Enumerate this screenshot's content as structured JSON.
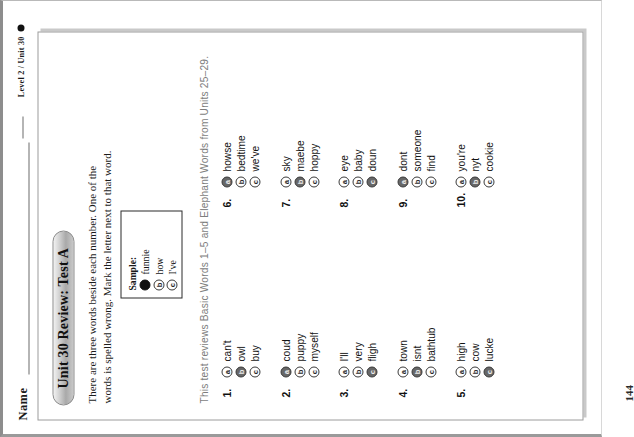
{
  "header": {
    "name_label": "Name",
    "level_label": "Level 2 / Unit 30"
  },
  "worksheet": {
    "title": "Unit 30 Review: Test A",
    "instructions": "There are three words beside each number. One of the words is spelled wrong. Mark the letter next to that word.",
    "review_line": "This test reviews Basic Words 1–5 and Elephant Words from Units 25–29.",
    "page_number": "144"
  },
  "sample": {
    "title": "Sample:",
    "options": [
      {
        "letter": "a",
        "word": "funnie",
        "marked": true
      },
      {
        "letter": "b",
        "word": "how",
        "marked": false
      },
      {
        "letter": "c",
        "word": "I've",
        "marked": false
      }
    ]
  },
  "questions_left": [
    {
      "number": "1.",
      "options": [
        {
          "letter": "a",
          "word": "can't",
          "marked": false
        },
        {
          "letter": "b",
          "word": "owl",
          "marked": true
        },
        {
          "letter": "c",
          "word": "buy",
          "marked": false
        }
      ]
    },
    {
      "number": "2.",
      "options": [
        {
          "letter": "a",
          "word": "coud",
          "marked": true
        },
        {
          "letter": "b",
          "word": "puppy",
          "marked": false
        },
        {
          "letter": "c",
          "word": "myself",
          "marked": false
        }
      ]
    },
    {
      "number": "3.",
      "options": [
        {
          "letter": "a",
          "word": "I'll",
          "marked": false
        },
        {
          "letter": "b",
          "word": "very",
          "marked": false
        },
        {
          "letter": "c",
          "word": "fligh",
          "marked": true
        }
      ]
    },
    {
      "number": "4.",
      "options": [
        {
          "letter": "a",
          "word": "town",
          "marked": false
        },
        {
          "letter": "b",
          "word": "isnt",
          "marked": true
        },
        {
          "letter": "c",
          "word": "bathtub",
          "marked": false
        }
      ]
    },
    {
      "number": "5.",
      "options": [
        {
          "letter": "a",
          "word": "high",
          "marked": false
        },
        {
          "letter": "b",
          "word": "cow",
          "marked": false
        },
        {
          "letter": "c",
          "word": "lucke",
          "marked": true
        }
      ]
    }
  ],
  "questions_right": [
    {
      "number": "6.",
      "options": [
        {
          "letter": "a",
          "word": "howse",
          "marked": true
        },
        {
          "letter": "b",
          "word": "bedtime",
          "marked": false
        },
        {
          "letter": "c",
          "word": "we've",
          "marked": false
        }
      ]
    },
    {
      "number": "7.",
      "options": [
        {
          "letter": "a",
          "word": "sky",
          "marked": false
        },
        {
          "letter": "b",
          "word": "maebe",
          "marked": true
        },
        {
          "letter": "c",
          "word": "hoppy",
          "marked": false
        }
      ]
    },
    {
      "number": "8.",
      "options": [
        {
          "letter": "a",
          "word": "eye",
          "marked": false
        },
        {
          "letter": "b",
          "word": "baby",
          "marked": false
        },
        {
          "letter": "c",
          "word": "doun",
          "marked": true
        }
      ]
    },
    {
      "number": "9.",
      "options": [
        {
          "letter": "a",
          "word": "dont",
          "marked": true
        },
        {
          "letter": "b",
          "word": "someone",
          "marked": false
        },
        {
          "letter": "c",
          "word": "find",
          "marked": false
        }
      ]
    },
    {
      "number": "10.",
      "options": [
        {
          "letter": "a",
          "word": "you're",
          "marked": false
        },
        {
          "letter": "b",
          "word": "nyt",
          "marked": true
        },
        {
          "letter": "c",
          "word": "cookie",
          "marked": false
        }
      ]
    }
  ]
}
